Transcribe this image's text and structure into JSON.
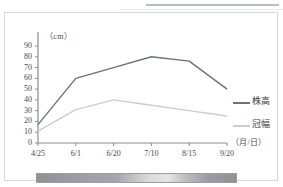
{
  "chart_data": {
    "type": "line",
    "title": "",
    "xlabel": "（月/日）",
    "ylabel": "（cm）",
    "x": [
      "4/25",
      "6/1",
      "6/20",
      "7/10",
      "8/15",
      "9/20"
    ],
    "categories": [
      "4/25",
      "6/1",
      "6/20",
      "7/10",
      "8/15",
      "9/20"
    ],
    "ylim": [
      0,
      90
    ],
    "yticks": [
      "0",
      "10",
      "20",
      "30",
      "40",
      "50",
      "60",
      "70",
      "80",
      "90"
    ],
    "grid": false,
    "legend_position": "right",
    "series": [
      {
        "name": "株高",
        "color": "#6d7178",
        "values": [
          17,
          60,
          70,
          80,
          76,
          50
        ]
      },
      {
        "name": "冠幅",
        "color": "#c9ccd1",
        "values": [
          11,
          31,
          40,
          35,
          30,
          25
        ]
      }
    ]
  },
  "axes": {
    "y_unit_label": "（cm）",
    "x_unit_label": "（月/日）",
    "y_ticks": [
      "90",
      "80",
      "70",
      "60",
      "50",
      "40",
      "30",
      "20",
      "10",
      "0"
    ],
    "x_ticks": [
      "4/25",
      "6/1",
      "6/20",
      "7/10",
      "8/15",
      "9/20"
    ]
  },
  "legend": {
    "items": [
      {
        "label": "株高",
        "color": "#6d7178"
      },
      {
        "label": "冠幅",
        "color": "#c9ccd1"
      }
    ]
  },
  "colors": {
    "series_primary": "#6d7178",
    "series_secondary": "#c9ccd1",
    "axis": "#8a8d92",
    "card_border": "#d6d8dc",
    "text": "#4a4a4a",
    "footer_bar": "#9a9da2"
  }
}
